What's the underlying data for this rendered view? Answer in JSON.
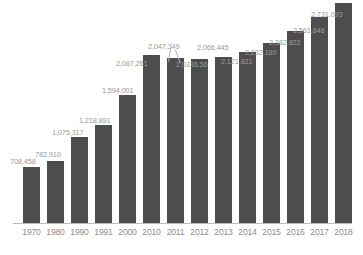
{
  "chart_data": {
    "type": "bar",
    "title": "",
    "subtitle": "",
    "xlabel": "",
    "ylabel": "",
    "grid": false,
    "legend": false,
    "legend_position": "none",
    "ylim": [
      0,
      2900000
    ],
    "bar_color": "#4d4d4d",
    "label_color": "#9a9a9a",
    "axis_color": "#b9b9b9",
    "background_color": "#ffffff",
    "categories": [
      "1970",
      "1980",
      "1990",
      "1991",
      "2000",
      "2010",
      "2011",
      "2012",
      "2013",
      "2014",
      "2015",
      "2016",
      "2017",
      "2018"
    ],
    "values": [
      708458,
      782910,
      1075317,
      1218891,
      1594001,
      2087261,
      2047349,
      2033656,
      2066445,
      2121831,
      2232189,
      2382822,
      2561848,
      2731093
    ],
    "data_labels": [
      "708,458",
      "782,910",
      "1,075,317",
      "1,218,891",
      "1,594,001",
      "2,087,261",
      "2,047,349",
      "2,0336.56",
      "2,066,445",
      "2,121,831",
      "2,232,189",
      "2,382,822",
      "2,561,848",
      "2,731,093"
    ],
    "points": [
      {
        "category": "1970",
        "value": 708458,
        "label": "708,458"
      },
      {
        "category": "1980",
        "value": 782910,
        "label": "782,910"
      },
      {
        "category": "1990",
        "value": 1075317,
        "label": "1,075,317"
      },
      {
        "category": "1991",
        "value": 1218891,
        "label": "1,218,891"
      },
      {
        "category": "2000",
        "value": 1594001,
        "label": "1,594,001"
      },
      {
        "category": "2010",
        "value": 2087261,
        "label": "2,087,261"
      },
      {
        "category": "2011",
        "value": 2047349,
        "label": "2,047,349"
      },
      {
        "category": "2012",
        "value": 2033656,
        "label": "2,0336.56"
      },
      {
        "category": "2013",
        "value": 2066445,
        "label": "2,066,445"
      },
      {
        "category": "2014",
        "value": 2121831,
        "label": "2,121,831"
      },
      {
        "category": "2015",
        "value": 2232189,
        "label": "2,232,189"
      },
      {
        "category": "2016",
        "value": 2382822,
        "label": "2,382,822"
      },
      {
        "category": "2017",
        "value": 2561848,
        "label": "2,561,848"
      },
      {
        "category": "2018",
        "value": 2731093,
        "label": "2,731,093"
      }
    ]
  }
}
